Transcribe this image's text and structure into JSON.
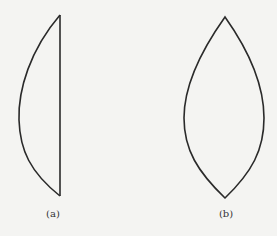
{
  "figure": {
    "panels": [
      {
        "id": "a",
        "label": "(a)",
        "shape": "plano-convex-lens-profile"
      },
      {
        "id": "b",
        "label": "(b)",
        "shape": "biconvex-lens-profile"
      }
    ],
    "colors": {
      "background": "#f4f4f2",
      "stroke": "#2a2a2a"
    }
  }
}
